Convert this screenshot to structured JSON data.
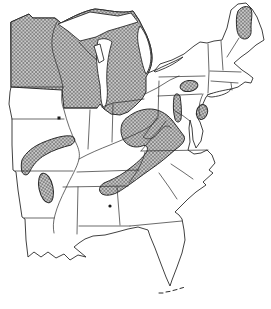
{
  "figure": {
    "kind": "species-range-map",
    "area_shown": "eastern-united-states",
    "title": "",
    "visible_text": ""
  },
  "colors": {
    "background": "#ffffff",
    "outline": "#2b2b2b",
    "hatch_background": "#c9c9c9",
    "hatch_line": "#6e6e6e",
    "dot": "#1a1a1a"
  },
  "map": {
    "shaded_regions": [
      {
        "id": "north-region",
        "label": "Minnesota / Wisconsin / Michigan block",
        "kind": "hatched-area"
      },
      {
        "id": "northern-maine",
        "label": "Northern Maine patch",
        "kind": "hatched-area"
      },
      {
        "id": "north-central-pennsylvania",
        "label": "North-central Pennsylvania oval",
        "kind": "hatched-area"
      },
      {
        "id": "central-pennsylvania-ridge",
        "label": "Central Pennsylvania finger",
        "kind": "hatched-area"
      },
      {
        "id": "new-jersey-highlands",
        "label": "Eastern Pennsylvania / New Jersey oval",
        "kind": "hatched-area"
      },
      {
        "id": "appalachian-band",
        "label": "Appalachians: WV/VA/KY/TN to NE Alabama-NW Georgia",
        "kind": "hatched-area"
      },
      {
        "id": "ozark-band",
        "label": "Ozark plateau band, S Missouri - N Arkansas",
        "kind": "hatched-area"
      },
      {
        "id": "ouachita-oval",
        "label": "Ouachita mountains oval, W Arkansas",
        "kind": "hatched-area"
      },
      {
        "id": "illinois-record-dot",
        "label": "Isolated record, western Illinois",
        "kind": "isolated-dot"
      },
      {
        "id": "alabama-record-dot",
        "label": "Isolated record, central Alabama",
        "kind": "isolated-dot"
      }
    ],
    "water_bodies": [
      {
        "id": "lake-superior"
      },
      {
        "id": "lake-michigan"
      },
      {
        "id": "green-bay"
      },
      {
        "id": "lake-huron"
      },
      {
        "id": "lake-erie-shore"
      },
      {
        "id": "lake-ontario"
      },
      {
        "id": "chesapeake-bay"
      }
    ]
  }
}
